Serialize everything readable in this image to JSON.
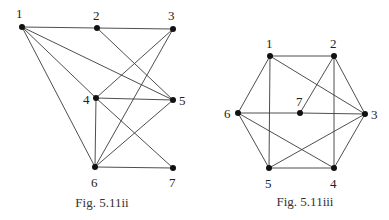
{
  "figures": [
    {
      "id": "fig-5-11ii",
      "caption": "Fig. 5.11ii",
      "caption_pos": [
        102,
        207
      ],
      "nodes": [
        {
          "label": "1",
          "x": 22,
          "y": 27,
          "lx": 16,
          "ly": 18
        },
        {
          "label": "2",
          "x": 97,
          "y": 28,
          "lx": 93,
          "ly": 20
        },
        {
          "label": "3",
          "x": 173,
          "y": 29,
          "lx": 168,
          "ly": 20
        },
        {
          "label": "4",
          "x": 96,
          "y": 98,
          "lx": 83,
          "ly": 104
        },
        {
          "label": "5",
          "x": 173,
          "y": 100,
          "lx": 179,
          "ly": 105
        },
        {
          "label": "6",
          "x": 95,
          "y": 167,
          "lx": 91,
          "ly": 187
        },
        {
          "label": "7",
          "x": 173,
          "y": 168,
          "lx": 169,
          "ly": 187
        }
      ],
      "edges": [
        [
          1,
          2
        ],
        [
          2,
          3
        ],
        [
          1,
          5
        ],
        [
          1,
          4
        ],
        [
          1,
          6
        ],
        [
          2,
          5
        ],
        [
          3,
          4
        ],
        [
          3,
          6
        ],
        [
          4,
          5
        ],
        [
          4,
          6
        ],
        [
          4,
          7
        ],
        [
          5,
          6
        ],
        [
          6,
          7
        ]
      ]
    },
    {
      "id": "fig-5-11iii",
      "caption": "Fig. 5.11iii",
      "caption_pos": [
        305,
        206
      ],
      "nodes": [
        {
          "label": "1",
          "x": 270,
          "y": 56,
          "lx": 266,
          "ly": 48
        },
        {
          "label": "2",
          "x": 334,
          "y": 56,
          "lx": 330,
          "ly": 48
        },
        {
          "label": "3",
          "x": 365,
          "y": 114,
          "lx": 371,
          "ly": 119
        },
        {
          "label": "4",
          "x": 334,
          "y": 168,
          "lx": 330,
          "ly": 188
        },
        {
          "label": "5",
          "x": 269,
          "y": 168,
          "lx": 265,
          "ly": 188
        },
        {
          "label": "6",
          "x": 238,
          "y": 113,
          "lx": 224,
          "ly": 118
        },
        {
          "label": "7",
          "x": 300,
          "y": 113,
          "lx": 296,
          "ly": 106
        }
      ],
      "edges": [
        [
          1,
          2
        ],
        [
          2,
          3
        ],
        [
          3,
          4
        ],
        [
          4,
          5
        ],
        [
          5,
          6
        ],
        [
          6,
          1
        ],
        [
          1,
          5
        ],
        [
          1,
          3
        ],
        [
          2,
          4
        ],
        [
          2,
          7
        ],
        [
          6,
          7
        ],
        [
          7,
          3
        ],
        [
          6,
          4
        ],
        [
          5,
          3
        ]
      ]
    }
  ]
}
